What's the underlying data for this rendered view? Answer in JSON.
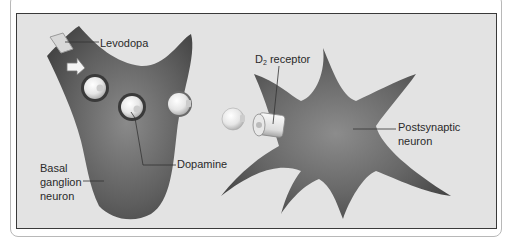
{
  "figure": {
    "labels": {
      "levodopa": "Levodopa",
      "d2_receptor_prefix": "D",
      "d2_receptor_sub": "2",
      "d2_receptor_suffix": " receptor",
      "postsynaptic_line1": "Postsynaptic",
      "postsynaptic_line2": "neuron",
      "dopamine": "Dopamine",
      "basal_line1": "Basal",
      "basal_line2": "ganglion",
      "basal_line3": "neuron"
    },
    "colors": {
      "panel_bg": "#e3e3e3",
      "neuron_dark": "#4a4a4a",
      "neuron_mid": "#7a7a7a",
      "vesicle": "#f0f0f0",
      "border": "#3a3a3a"
    }
  }
}
